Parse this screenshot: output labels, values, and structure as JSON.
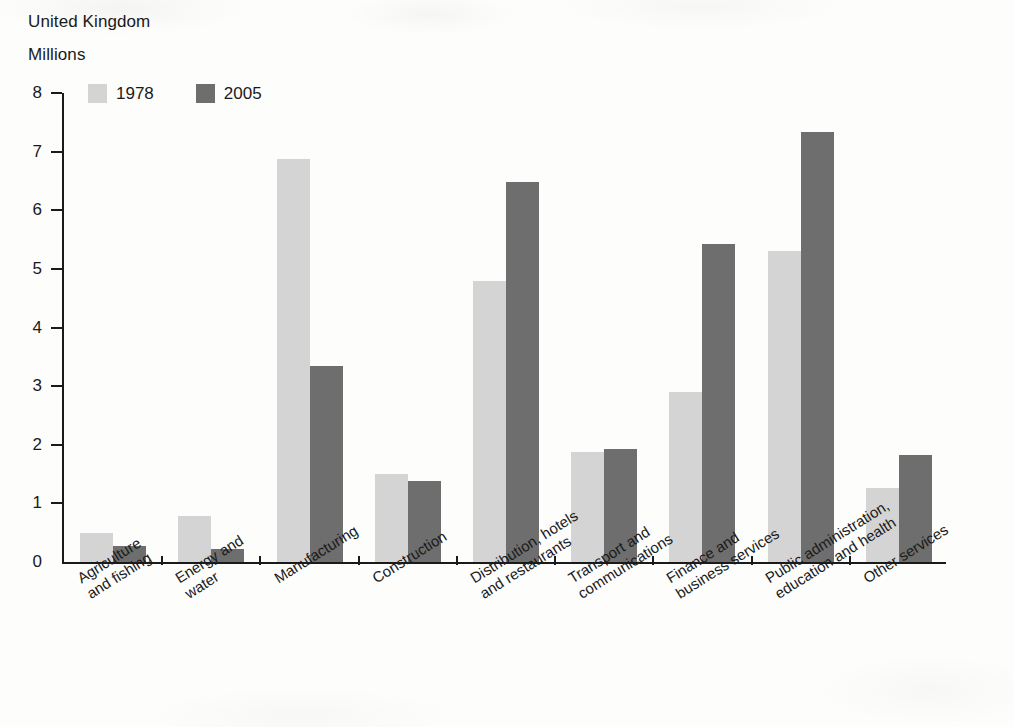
{
  "header": {
    "country": "United Kingdom",
    "units": "Millions"
  },
  "legend": {
    "position": "top-left",
    "items": [
      {
        "label": "1978",
        "color": "#d4d4d4"
      },
      {
        "label": "2005",
        "color": "#6e6e6e"
      }
    ]
  },
  "axis": {
    "y_ticks": [
      "8",
      "7",
      "6",
      "5",
      "4",
      "3",
      "2",
      "1",
      "0"
    ]
  },
  "chart_data": {
    "type": "bar",
    "title": "United Kingdom",
    "subtitle": "Millions",
    "xlabel": "",
    "ylabel": "Millions",
    "ylim": [
      0,
      8
    ],
    "ytick_step": 1,
    "grid": false,
    "legend_position": "top-left",
    "categories": [
      "Agriculture\nand fishing",
      "Energy and\nwater",
      "Manufacturing",
      "Construction",
      "Distribution, hotels\nand restaurants",
      "Transport and\ncommunications",
      "Finance and\nbusiness services",
      "Public administration,\neducation and health",
      "Other services"
    ],
    "series": [
      {
        "name": "1978",
        "color": "#d4d4d4",
        "values": [
          0.5,
          0.78,
          6.88,
          1.5,
          4.8,
          1.87,
          2.9,
          5.3,
          1.27
        ]
      },
      {
        "name": "2005",
        "color": "#6e6e6e",
        "values": [
          0.27,
          0.22,
          3.35,
          1.38,
          6.48,
          1.92,
          5.42,
          7.33,
          1.83
        ]
      }
    ]
  }
}
